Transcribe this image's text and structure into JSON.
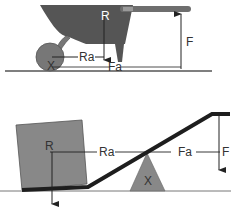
{
  "colors": {
    "background": "#ffffff",
    "bucket": "#555555",
    "wheel": "#777777",
    "handle": "#6e6e6e",
    "box": "#888888",
    "fulcrum": "#888888",
    "lever_bar": "#1e1e1e",
    "ground": "#555555",
    "lines": "#222222",
    "text": "#333333"
  },
  "diagrams": [
    {
      "name": "wheelbarrow",
      "description": "Second-class lever: wheelbarrow with fulcrum at wheel axle",
      "labels": {
        "resistance": "R",
        "resistance_arm": "Ra",
        "force_arm": "Fa",
        "force": "F",
        "fulcrum": "X"
      },
      "force_direction": "up",
      "resistance_direction": "down"
    },
    {
      "name": "lever-bar",
      "description": "First-class lever: bar lifting a box over a triangular fulcrum",
      "labels": {
        "resistance": "R",
        "resistance_arm": "Ra",
        "force_arm": "Fa",
        "force": "F",
        "fulcrum": "X"
      },
      "force_direction": "down",
      "resistance_direction": "down"
    }
  ]
}
